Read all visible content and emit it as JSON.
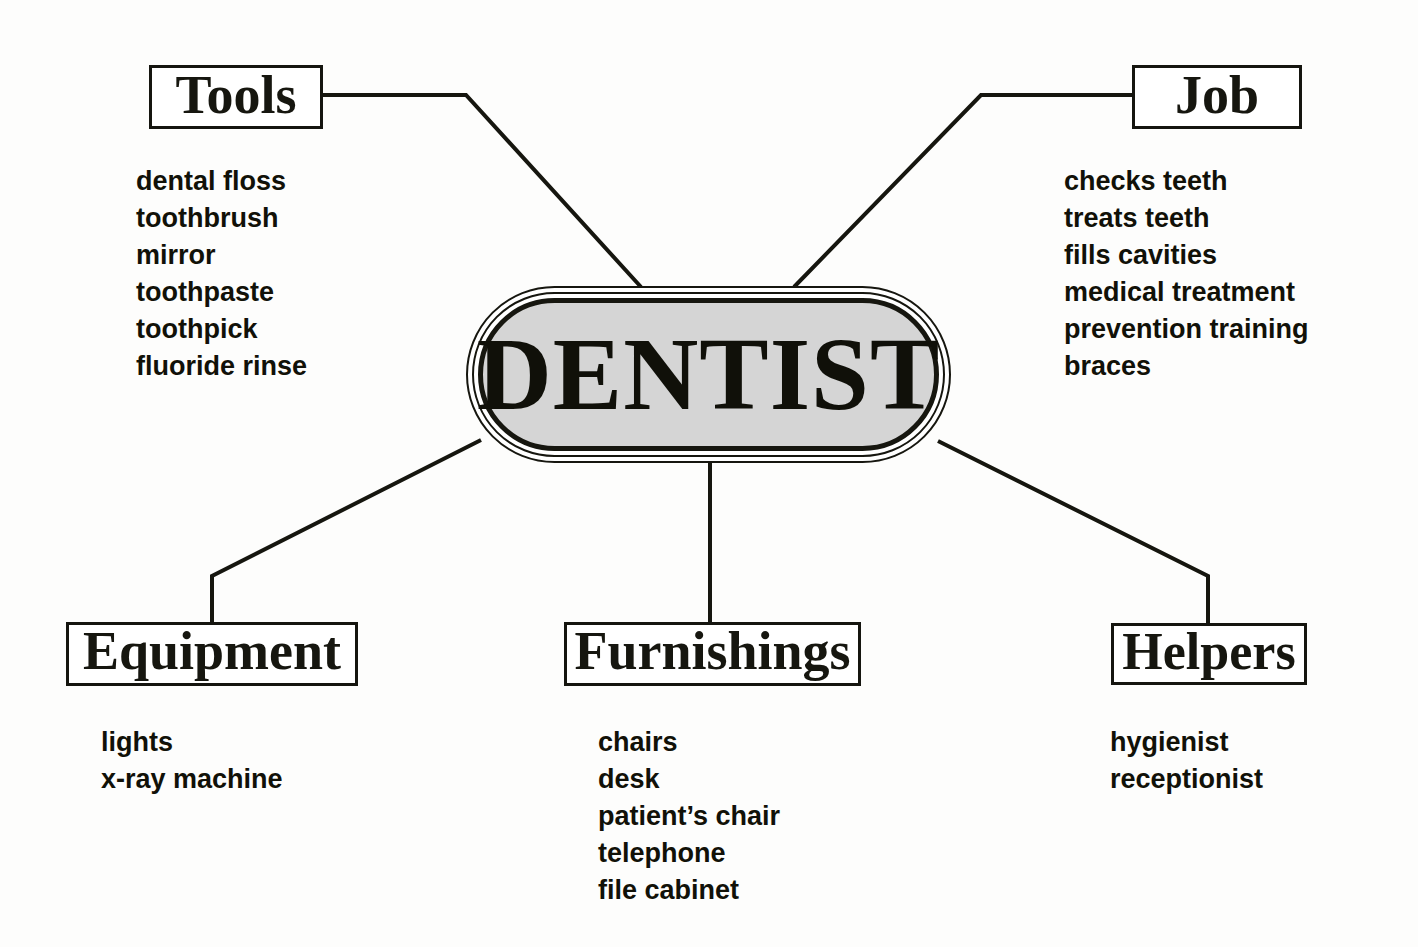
{
  "diagram": {
    "type": "concept-web",
    "center": {
      "label": "DENTIST",
      "fill_color": "#d5d5d5",
      "border_color": "#16160f"
    },
    "line_color": "#16160f",
    "background_color": "#fdfdfc",
    "branches": [
      {
        "id": "tools",
        "label": "Tools",
        "position": "top-left",
        "items": [
          "dental floss",
          "toothbrush",
          "mirror",
          "toothpaste",
          "toothpick",
          "fluoride rinse"
        ]
      },
      {
        "id": "job",
        "label": "Job",
        "position": "top-right",
        "items": [
          "checks teeth",
          "treats teeth",
          "fills cavities",
          "medical treatment",
          "prevention training",
          "braces"
        ]
      },
      {
        "id": "equipment",
        "label": "Equipment",
        "position": "bottom-left",
        "items": [
          "lights",
          "x-ray machine"
        ]
      },
      {
        "id": "furnishings",
        "label": "Furnishings",
        "position": "bottom-center",
        "items": [
          "chairs",
          "desk",
          "patient’s chair",
          "telephone",
          "file cabinet"
        ]
      },
      {
        "id": "helpers",
        "label": "Helpers",
        "position": "bottom-right",
        "items": [
          "hygienist",
          "receptionist"
        ]
      }
    ]
  }
}
